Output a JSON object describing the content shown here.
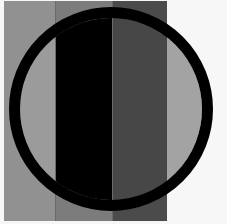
{
  "figure": {
    "title": "Circle over vertical gray stripes (lightness illusion)",
    "canvas": {
      "width": 227,
      "height": 224,
      "background": "#f7f7f7"
    },
    "stripes": [
      {
        "name": "stripe-1",
        "x": 4,
        "width": 51,
        "color_outside": "#919191",
        "color_inside": "#9b9b9b"
      },
      {
        "name": "stripe-2",
        "x": 55,
        "width": 57,
        "color_outside": "#7c7c7c",
        "color_inside": "#000000"
      },
      {
        "name": "stripe-3",
        "x": 112,
        "width": 55,
        "color_outside": "#4b4b4b",
        "color_inside": "#474747"
      },
      {
        "name": "stripe-4",
        "x": 167,
        "width": 56,
        "color_outside": "#f7f7f7",
        "color_inside": "#a3a3a3"
      }
    ],
    "stripe_top": 1,
    "stripe_bottom": 221,
    "circle": {
      "cx": 111,
      "cy": 109,
      "r_outer": 102,
      "ring_width": 11,
      "ring_color": "#000000"
    },
    "stripe_divider_color": "#6a6a6a"
  }
}
